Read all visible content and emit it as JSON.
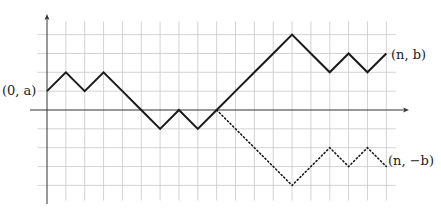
{
  "diagram": {
    "grid": {
      "unit_px": 18.85,
      "origin_px": [
        47,
        110
      ],
      "x_range": [
        -0.5,
        18.5
      ],
      "y_range": [
        -4.8,
        4.7
      ],
      "line_color": "#c8c8c8",
      "axis_color": "#333333"
    },
    "labels": {
      "start": "(0, a)",
      "end_upper": "(n, b)",
      "end_lower": "(n, −b)"
    },
    "paths": [
      {
        "name": "original-path",
        "style": "solid",
        "color": "#1a1a1a",
        "points": [
          [
            0,
            1
          ],
          [
            1,
            2
          ],
          [
            2,
            1
          ],
          [
            3,
            2
          ],
          [
            4,
            1
          ],
          [
            5,
            0
          ],
          [
            6,
            -1
          ],
          [
            7,
            0
          ],
          [
            8,
            -1
          ],
          [
            9,
            0
          ],
          [
            10,
            1
          ],
          [
            11,
            2
          ],
          [
            12,
            3
          ],
          [
            13,
            4
          ],
          [
            14,
            3
          ],
          [
            15,
            2
          ],
          [
            16,
            3
          ],
          [
            17,
            2
          ],
          [
            18,
            3
          ]
        ]
      },
      {
        "name": "reflected-path",
        "style": "dotted",
        "color": "#1a1a1a",
        "points": [
          [
            9,
            0
          ],
          [
            10,
            -1
          ],
          [
            11,
            -2
          ],
          [
            12,
            -3
          ],
          [
            13,
            -4
          ],
          [
            14,
            -3
          ],
          [
            15,
            -2
          ],
          [
            16,
            -3
          ],
          [
            17,
            -2
          ],
          [
            18,
            -3
          ]
        ]
      }
    ]
  }
}
